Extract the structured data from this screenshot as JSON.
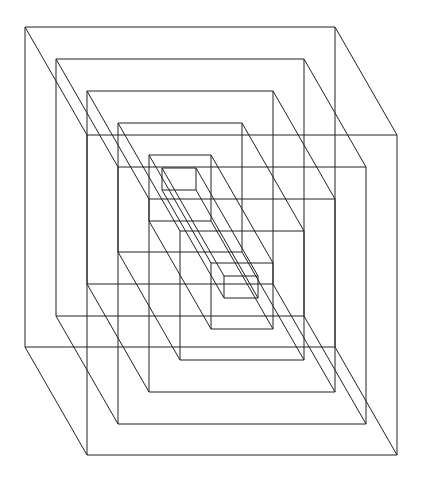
{
  "figure": {
    "type": "nested-wireframe-cubes",
    "stroke_color": "#222222",
    "background": "#ffffff",
    "depth_offset": [
      62,
      108
    ],
    "cubes": [
      {
        "front": [
          25,
          27,
          335,
          347
        ]
      },
      {
        "front": [
          56,
          59,
          304,
          316
        ]
      },
      {
        "front": [
          87,
          91,
          273,
          284
        ]
      },
      {
        "front": [
          118,
          123,
          242,
          252
        ]
      },
      {
        "front": [
          149,
          155,
          211,
          221
        ]
      },
      {
        "front": [
          162,
          168,
          196,
          190
        ]
      }
    ]
  }
}
